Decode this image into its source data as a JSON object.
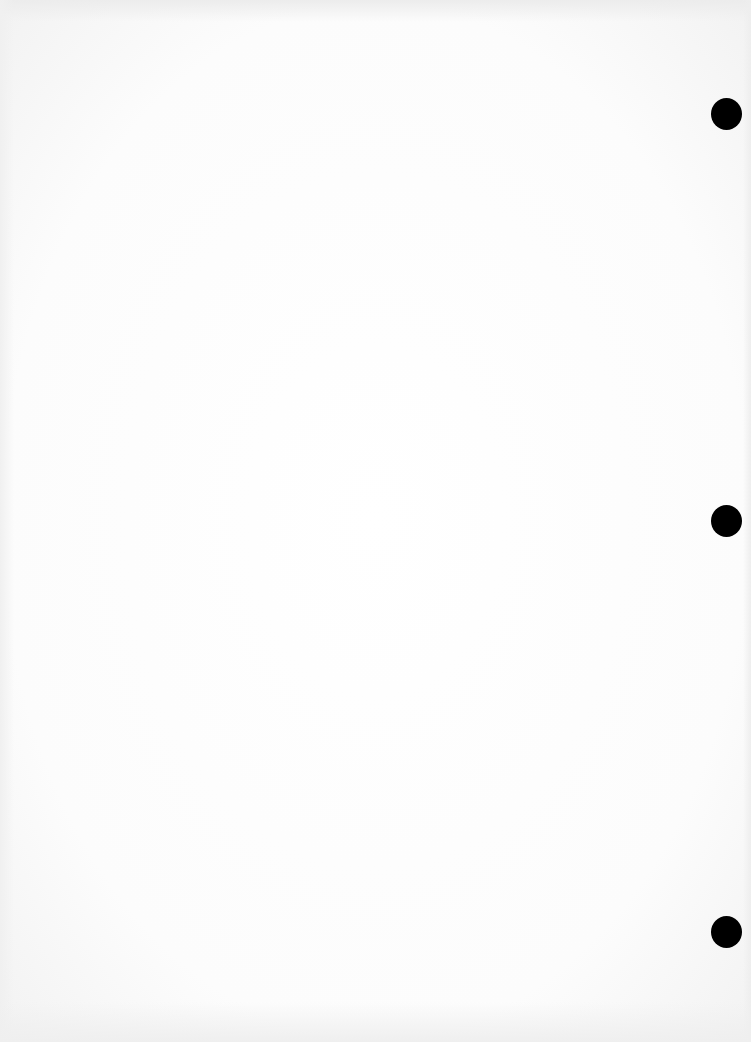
{
  "document": {
    "content": "",
    "hole_punches": [
      {
        "x": 727,
        "y": 114
      },
      {
        "x": 727,
        "y": 521
      },
      {
        "x": 727,
        "y": 932
      }
    ],
    "hole_color": "#000000",
    "paper_color": "#ffffff"
  }
}
